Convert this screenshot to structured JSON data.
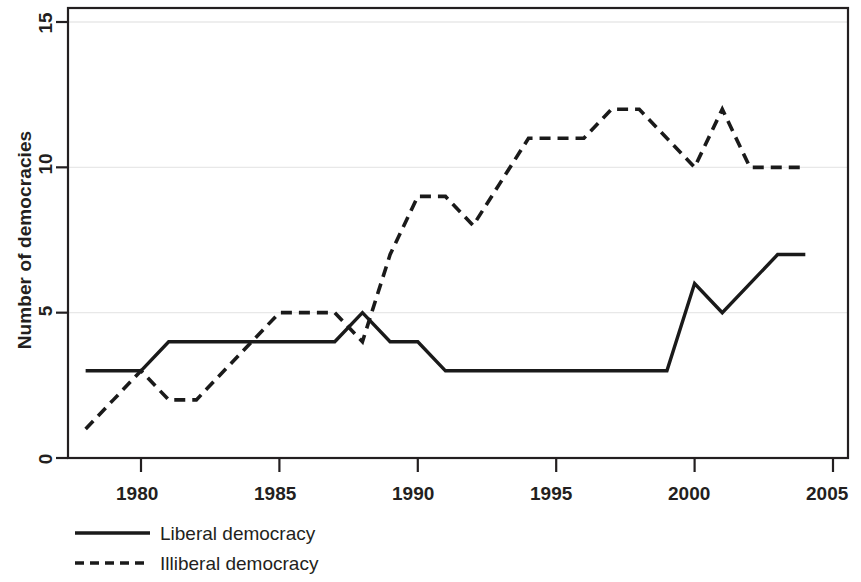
{
  "chart_data": {
    "type": "line",
    "title": "",
    "xlabel": "",
    "ylabel": "Number of democracies",
    "xlim": [
      1977.5,
      2005.5
    ],
    "ylim": [
      0,
      15.5
    ],
    "grid": true,
    "xticks": [
      1980,
      1985,
      1990,
      1995,
      2000,
      2005
    ],
    "xtick_labels": [
      "1980",
      "1985",
      "1990",
      "1995",
      "2000",
      "2005"
    ],
    "yticks": [
      0,
      5,
      10,
      15
    ],
    "ytick_labels": [
      "0",
      "5",
      "10",
      "15"
    ],
    "legend_position": "below-left",
    "x": [
      1978,
      1979,
      1980,
      1981,
      1982,
      1983,
      1984,
      1985,
      1986,
      1987,
      1988,
      1989,
      1990,
      1991,
      1992,
      1993,
      1994,
      1995,
      1996,
      1997,
      1998,
      1999,
      2000,
      2001,
      2002,
      2003,
      2004
    ],
    "series": [
      {
        "name": "Liberal democracy",
        "style": "solid",
        "color": "#1a1a1a",
        "values": [
          3,
          3,
          3,
          4,
          4,
          4,
          4,
          4,
          4,
          4,
          5,
          4,
          4,
          3,
          3,
          3,
          3,
          3,
          3,
          3,
          3,
          3,
          6,
          5,
          6,
          7,
          7
        ]
      },
      {
        "name": "Illiberal democracy",
        "style": "dashed",
        "color": "#1a1a1a",
        "values": [
          1,
          2,
          3,
          2,
          2,
          3,
          4,
          5,
          5,
          5,
          4,
          7,
          9,
          9,
          8,
          9.5,
          11,
          11,
          11,
          12,
          12,
          11,
          10,
          12,
          10,
          10,
          10
        ]
      }
    ]
  },
  "legend": {
    "items": [
      {
        "label": "Liberal democracy",
        "style": "solid"
      },
      {
        "label": "Illiberal democracy",
        "style": "dashed"
      }
    ]
  }
}
